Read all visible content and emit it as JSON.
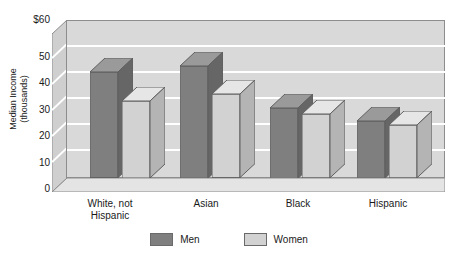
{
  "chart_data": {
    "type": "bar",
    "title": "",
    "xlabel": "",
    "ylabel": "Median Income\n(thousands)",
    "ylim": [
      0,
      60
    ],
    "yticks": [
      {
        "value": 60,
        "label": "$60"
      },
      {
        "value": 50,
        "label": "50"
      },
      {
        "value": 40,
        "label": "40"
      },
      {
        "value": 30,
        "label": "30"
      },
      {
        "value": 20,
        "label": "20"
      },
      {
        "value": 10,
        "label": "10"
      },
      {
        "value": 0,
        "label": "0"
      }
    ],
    "categories": [
      "White, not\nHispanic",
      "Asian",
      "Black",
      "Hispanic"
    ],
    "series": [
      {
        "name": "Men",
        "color": "#7f7f7f",
        "values": [
          48,
          51,
          32,
          26
        ]
      },
      {
        "name": "Women",
        "color": "#d2d2d2",
        "values": [
          35,
          38,
          29,
          24
        ]
      }
    ],
    "grid": "horizontal-white",
    "legend_position": "bottom-center",
    "style": "3d-bar"
  },
  "colors": {
    "plot_background": "#d9d9d9",
    "gridline": "#ffffff",
    "axis_line": "#8d8d8d",
    "men_front": "#7f7f7f",
    "men_top": "#9a9a9a",
    "men_side": "#666666",
    "women_front": "#d2d2d2",
    "women_top": "#e6e6e6",
    "women_side": "#b4b4b4",
    "floor": "#e2e2e2",
    "text": "#1a1a1a"
  },
  "legend": {
    "items": [
      {
        "label": "Men"
      },
      {
        "label": "Women"
      }
    ]
  }
}
